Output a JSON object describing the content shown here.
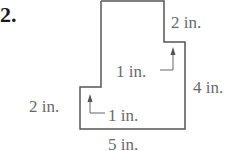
{
  "problem": {
    "number": "2."
  },
  "figure": {
    "shape": "L-shaped polygon",
    "stroke_color": "#555555",
    "label_color": "#6a6a6a",
    "labels": {
      "top_right_step": "2 in.",
      "inner_right_arrow": "1 in.",
      "right_side": "4 in.",
      "left_side": "2 in.",
      "inner_left_arrow": "1 in.",
      "bottom": "5 in."
    }
  }
}
